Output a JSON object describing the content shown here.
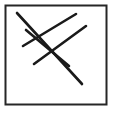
{
  "figure": {
    "canvas": {
      "width": 113,
      "height": 113
    },
    "background_color": "#ffffff",
    "stroke_color": "#1a1a1a",
    "border_color": "#262626"
  },
  "frame": {
    "name": "outer-square-frame",
    "x": 5.5,
    "y": 5.5,
    "width": 101,
    "height": 99,
    "stroke_width": 2,
    "fill": "#ffffff",
    "stroke": "#262626"
  },
  "strokes": [
    {
      "id": "stroke-down-right-long",
      "direction": "down-right",
      "x1": 17,
      "y1": 13,
      "x2": 82,
      "y2": 84,
      "stroke_width": 2.6,
      "color": "#1a1a1a"
    },
    {
      "id": "stroke-down-right-short",
      "direction": "down-right",
      "x1": 26,
      "y1": 30,
      "x2": 69,
      "y2": 66,
      "stroke_width": 2.6,
      "color": "#1a1a1a"
    },
    {
      "id": "stroke-up-right-upper",
      "direction": "up-right",
      "x1": 23,
      "y1": 46,
      "x2": 76,
      "y2": 14,
      "stroke_width": 2.6,
      "color": "#1a1a1a"
    },
    {
      "id": "stroke-up-right-lower",
      "direction": "up-right",
      "x1": 34,
      "y1": 64,
      "x2": 86,
      "y2": 26,
      "stroke_width": 2.6,
      "color": "#1a1a1a"
    }
  ],
  "intersections": [
    {
      "id": "crossing-upper-left",
      "x": 30,
      "y": 42
    },
    {
      "id": "crossing-center",
      "x": 43,
      "y": 59
    },
    {
      "id": "crossing-mid-upper",
      "x": 45,
      "y": 33
    },
    {
      "id": "crossing-mid-lower",
      "x": 58,
      "y": 51
    }
  ]
}
